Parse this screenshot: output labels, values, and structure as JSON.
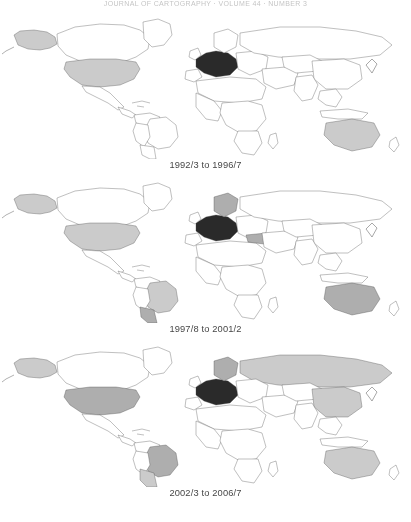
{
  "figure": {
    "running_header": "JOURNAL OF CARTOGRAPHY · VOLUME 44 · NUMBER 3",
    "bottom_note": "",
    "projection": "world-equirectangular",
    "panel_count": 3
  },
  "legend": {
    "shade_black": "#1a1a1a",
    "shade_dark": "#8f8f8f",
    "shade_mid": "#a8a8a8",
    "shade_light": "#c8c8c8",
    "shade_none": "#ffffff",
    "outline": "#3a3a3a"
  },
  "panels": [
    {
      "id": "panel-1",
      "caption": "1992/3 to 1996/7",
      "regions": [
        {
          "name": "united-states",
          "shade": "light"
        },
        {
          "name": "alaska",
          "shade": "light"
        },
        {
          "name": "western-europe",
          "shade": "black"
        },
        {
          "name": "australia",
          "shade": "light"
        }
      ]
    },
    {
      "id": "panel-2",
      "caption": "1997/8 to 2001/2",
      "regions": [
        {
          "name": "united-states",
          "shade": "light"
        },
        {
          "name": "alaska",
          "shade": "light"
        },
        {
          "name": "western-europe",
          "shade": "black"
        },
        {
          "name": "scandinavia",
          "shade": "mid"
        },
        {
          "name": "turkey",
          "shade": "mid"
        },
        {
          "name": "brazil",
          "shade": "light"
        },
        {
          "name": "argentina",
          "shade": "mid"
        },
        {
          "name": "australia",
          "shade": "mid"
        }
      ]
    },
    {
      "id": "panel-3",
      "caption": "2002/3 to 2006/7",
      "regions": [
        {
          "name": "united-states",
          "shade": "mid"
        },
        {
          "name": "alaska",
          "shade": "light"
        },
        {
          "name": "western-europe",
          "shade": "black"
        },
        {
          "name": "scandinavia",
          "shade": "mid"
        },
        {
          "name": "russia",
          "shade": "light"
        },
        {
          "name": "china",
          "shade": "light"
        },
        {
          "name": "brazil",
          "shade": "mid"
        },
        {
          "name": "argentina",
          "shade": "light"
        },
        {
          "name": "australia",
          "shade": "light"
        }
      ]
    }
  ]
}
